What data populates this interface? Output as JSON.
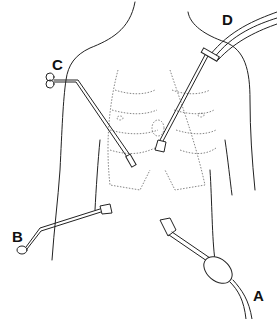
{
  "figure": {
    "labels": [
      {
        "id": "A",
        "text": "A",
        "x": 253,
        "y": 288
      },
      {
        "id": "B",
        "text": "B",
        "x": 12,
        "y": 229
      },
      {
        "id": "C",
        "text": "C",
        "x": 52,
        "y": 57
      },
      {
        "id": "D",
        "text": "D",
        "x": 222,
        "y": 12
      }
    ]
  }
}
